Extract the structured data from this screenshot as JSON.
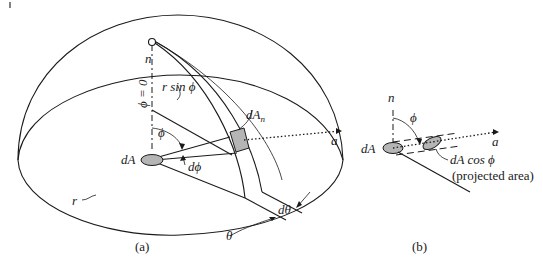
{
  "figure": {
    "panel_a": {
      "caption": "(a)",
      "labels": {
        "normal": "n",
        "phi_zero": "ϕ = 0",
        "r_sin_phi": "r sin ϕ",
        "dA_n_base": "dA",
        "dA_n_sub": "n",
        "phi": "ϕ",
        "dA": "dA",
        "d_phi": "dϕ",
        "r": "r",
        "a": "a",
        "d_theta": "dθ",
        "theta": "θ"
      }
    },
    "panel_b": {
      "caption": "(b)",
      "labels": {
        "normal": "n",
        "phi": "ϕ",
        "dA": "dA",
        "a": "a",
        "dA_cos_phi": "dA cos ϕ",
        "projected_area": "(projected area)"
      }
    }
  }
}
